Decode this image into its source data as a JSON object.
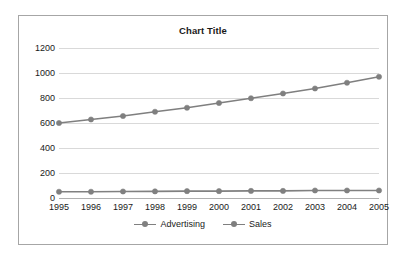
{
  "chart_data": {
    "type": "line",
    "title": "Chart Title",
    "xlabel": "",
    "ylabel": "",
    "categories": [
      "1995",
      "1996",
      "1997",
      "1998",
      "1999",
      "2000",
      "2001",
      "2002",
      "2003",
      "2004",
      "2005"
    ],
    "series": [
      {
        "name": "Advertising",
        "color": "#808080",
        "marker": "circle",
        "values": [
          50,
          50,
          52,
          53,
          55,
          55,
          57,
          57,
          60,
          60,
          60
        ]
      },
      {
        "name": "Sales",
        "color": "#7f7f7f",
        "marker": "circle",
        "values": [
          600,
          628,
          656,
          690,
          722,
          760,
          798,
          836,
          876,
          922,
          970
        ]
      }
    ],
    "ylim": [
      0,
      1200
    ],
    "yticks": [
      0,
      200,
      400,
      600,
      800,
      1000,
      1200
    ],
    "ytick_labels": [
      "0",
      "200",
      "400",
      "600",
      "800",
      "1000",
      "1200"
    ],
    "grid": "horizontal",
    "legend_position": "bottom",
    "plot_background": "#ffffff",
    "gridline_color": "#d9d9d9",
    "border_color": "#a6a6a6"
  }
}
